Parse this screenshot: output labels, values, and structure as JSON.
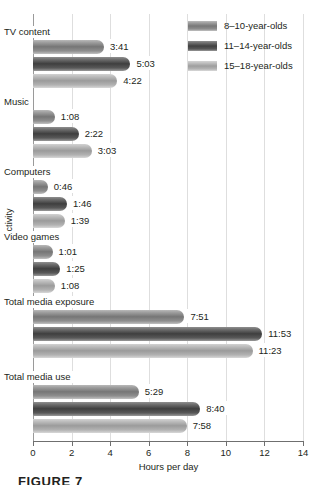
{
  "chart_data": {
    "type": "bar",
    "orientation": "horizontal",
    "title": "",
    "xlabel": "Hours per day",
    "ylabel": "Activity",
    "xlim": [
      0,
      14
    ],
    "xticks": [
      "0",
      "2",
      "4",
      "6",
      "8",
      "10",
      "12",
      "14"
    ],
    "grid": true,
    "legend_position": "top-right",
    "categories": [
      "TV content",
      "Music",
      "Computers",
      "Video games",
      "Total media exposure",
      "Total media use"
    ],
    "series": [
      {
        "name": "8–10-year-olds",
        "color": "#787878",
        "labels": [
          "3:41",
          "1:08",
          "0:46",
          "1:01",
          "7:51",
          "5:29"
        ],
        "values": [
          3.683,
          1.133,
          0.767,
          1.017,
          7.85,
          5.483
        ]
      },
      {
        "name": "11–14-year-olds",
        "color": "#414141",
        "labels": [
          "5:03",
          "2:22",
          "1:46",
          "1:25",
          "11:53",
          "8:40"
        ],
        "values": [
          5.05,
          2.367,
          1.767,
          1.417,
          11.883,
          8.667
        ]
      },
      {
        "name": "15–18-year-olds",
        "color": "#9e9e9e",
        "labels": [
          "4:22",
          "3:03",
          "1:39",
          "1:08",
          "11:23",
          "7:58"
        ],
        "values": [
          4.367,
          3.05,
          1.65,
          1.133,
          11.383,
          7.967
        ]
      }
    ]
  },
  "figure": {
    "caption": "FIGURE 7"
  }
}
